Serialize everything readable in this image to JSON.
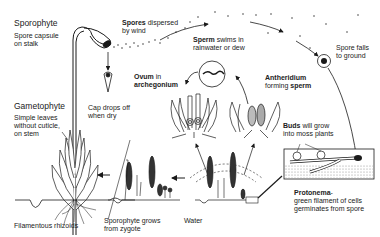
{
  "diagram": {
    "labels": {
      "sporophyte_title": "Sporophyte",
      "spore_capsule": [
        "Spore capsule",
        "on stalk"
      ],
      "spores_bold": "Spores",
      "spores_rest": " dispersed",
      "spores_line2": "by wind",
      "sperm_bold": "Sperm",
      "sperm_rest": " swims in",
      "sperm_line2": "rainwater or dew",
      "spore_falls": [
        "Spore falls",
        "to ground"
      ],
      "ovum_bold": "Ovum",
      "ovum_rest": " in",
      "archegonium": "archegonium",
      "antheridium": "Antheridium",
      "forming": "forming ",
      "sperm_word": "sperm",
      "gametophyte_title": "Gametophyte",
      "simple_leaves": [
        "Simple leaves",
        "without cuticle,",
        "on stem"
      ],
      "cap_drops": [
        "Cap drops off",
        "when dry"
      ],
      "buds_bold": "Buds",
      "buds_rest": " will grow",
      "buds_line2": "into moss plants",
      "protonema_bold": "Protonema",
      "protonema_rest": "-",
      "protonema_lines": [
        "green filament of cells",
        "germinates from spore"
      ],
      "rhizoids": "Filamentous rhizoids",
      "sporophyte_grows": [
        "Sporophyte grows",
        "from zygote"
      ],
      "water": "Water"
    },
    "colors": {
      "ink": "#1a1a1a",
      "background": "#ffffff",
      "soil": "#d9d9d9"
    }
  }
}
